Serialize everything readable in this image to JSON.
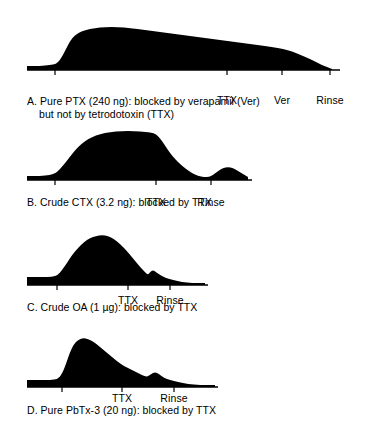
{
  "figure": {
    "type": "multi-panel-recording-traces",
    "panel_count": 4,
    "ink_color": "#000000",
    "background_color": "#ffffff"
  },
  "panels": [
    {
      "id": "A",
      "caption_line1": "A. Pure PTX (240 ng): blocked by verapamil (Ver)",
      "caption_line2": "but not by tetrodotoxin (TTX)",
      "axis_markers": [
        {
          "label": "",
          "x": 55
        },
        {
          "label": "TTX",
          "x": 227
        },
        {
          "label": "Ver",
          "x": 282
        },
        {
          "label": "Rinse",
          "x": 330
        }
      ]
    },
    {
      "id": "B",
      "caption_line1": "B. Crude CTX (3.2 ng): blocked by TTX",
      "caption_line2": "",
      "axis_markers": [
        {
          "label": "",
          "x": 55
        },
        {
          "label": "TTX",
          "x": 156
        },
        {
          "label": "Rinse",
          "x": 211
        }
      ]
    },
    {
      "id": "C",
      "caption_line1": "C. Crude OA (1 µg): blocked by TTX",
      "caption_line2": "",
      "axis_markers": [
        {
          "label": "",
          "x": 57
        },
        {
          "label": "TTX",
          "x": 128
        },
        {
          "label": "Rinse",
          "x": 170
        }
      ]
    },
    {
      "id": "D",
      "caption_line1": "D. Pure PbTx-3 (20 ng): blocked by TTX",
      "caption_line2": "",
      "axis_markers": [
        {
          "label": "",
          "x": 62
        },
        {
          "label": "TTX",
          "x": 122
        },
        {
          "label": "Rinse",
          "x": 174
        }
      ]
    }
  ],
  "chart_data": {
    "type": "area",
    "title": "",
    "xlabel": "",
    "ylabel": "",
    "grid": false,
    "legend": "none",
    "series": [
      {
        "name": "A. Pure PTX (240 ng)",
        "baseline_y": 70,
        "x_start": 27,
        "x_end": 332,
        "points": [
          [
            27,
            66
          ],
          [
            40,
            66
          ],
          [
            50,
            65
          ],
          [
            56,
            64
          ],
          [
            60,
            60
          ],
          [
            64,
            53
          ],
          [
            68,
            45
          ],
          [
            72,
            38
          ],
          [
            78,
            33
          ],
          [
            85,
            30
          ],
          [
            95,
            28
          ],
          [
            105,
            27
          ],
          [
            118,
            27
          ],
          [
            130,
            28
          ],
          [
            145,
            30
          ],
          [
            160,
            32
          ],
          [
            175,
            34
          ],
          [
            190,
            36
          ],
          [
            205,
            38
          ],
          [
            220,
            40
          ],
          [
            235,
            42
          ],
          [
            250,
            44
          ],
          [
            265,
            46
          ],
          [
            278,
            48
          ],
          [
            288,
            50
          ],
          [
            296,
            53
          ],
          [
            303,
            56
          ],
          [
            310,
            59
          ],
          [
            316,
            62
          ],
          [
            322,
            65
          ],
          [
            327,
            67
          ],
          [
            332,
            69
          ]
        ]
      },
      {
        "name": "B. Crude CTX (3.2 ng)",
        "baseline_y": 180,
        "x_start": 27,
        "x_end": 248,
        "points": [
          [
            27,
            176
          ],
          [
            40,
            176
          ],
          [
            50,
            175
          ],
          [
            56,
            173
          ],
          [
            60,
            169
          ],
          [
            66,
            162
          ],
          [
            72,
            154
          ],
          [
            78,
            147
          ],
          [
            85,
            141
          ],
          [
            92,
            137
          ],
          [
            100,
            134
          ],
          [
            110,
            132
          ],
          [
            122,
            131
          ],
          [
            134,
            131
          ],
          [
            146,
            132
          ],
          [
            154,
            133
          ],
          [
            158,
            136
          ],
          [
            162,
            141
          ],
          [
            166,
            147
          ],
          [
            170,
            153
          ],
          [
            175,
            159
          ],
          [
            180,
            164
          ],
          [
            186,
            169
          ],
          [
            192,
            173
          ],
          [
            198,
            176
          ],
          [
            204,
            177
          ],
          [
            209,
            177
          ],
          [
            213,
            175
          ],
          [
            218,
            171
          ],
          [
            223,
            168
          ],
          [
            228,
            167
          ],
          [
            233,
            168
          ],
          [
            238,
            171
          ],
          [
            243,
            174
          ],
          [
            248,
            177
          ]
        ]
      },
      {
        "name": "C. Crude OA (1 µg)",
        "baseline_y": 285,
        "x_start": 27,
        "x_end": 205,
        "points": [
          [
            27,
            277
          ],
          [
            42,
            277
          ],
          [
            52,
            277
          ],
          [
            58,
            275
          ],
          [
            62,
            270
          ],
          [
            67,
            263
          ],
          [
            72,
            255
          ],
          [
            78,
            248
          ],
          [
            84,
            242
          ],
          [
            90,
            238
          ],
          [
            96,
            236
          ],
          [
            102,
            235
          ],
          [
            108,
            236
          ],
          [
            114,
            239
          ],
          [
            120,
            244
          ],
          [
            126,
            250
          ],
          [
            131,
            256
          ],
          [
            136,
            262
          ],
          [
            141,
            268
          ],
          [
            145,
            272
          ],
          [
            148,
            275
          ],
          [
            150,
            272
          ],
          [
            153,
            270
          ],
          [
            156,
            272
          ],
          [
            160,
            275
          ],
          [
            166,
            278
          ],
          [
            173,
            280
          ],
          [
            182,
            282
          ],
          [
            192,
            283
          ],
          [
            205,
            283
          ]
        ]
      },
      {
        "name": "D. Pure PbTx-3 (20 ng)",
        "baseline_y": 387,
        "x_start": 27,
        "x_end": 215,
        "points": [
          [
            27,
            380
          ],
          [
            40,
            380
          ],
          [
            50,
            380
          ],
          [
            58,
            379
          ],
          [
            62,
            374
          ],
          [
            66,
            364
          ],
          [
            70,
            352
          ],
          [
            74,
            344
          ],
          [
            78,
            340
          ],
          [
            83,
            338
          ],
          [
            88,
            339
          ],
          [
            94,
            342
          ],
          [
            100,
            347
          ],
          [
            106,
            352
          ],
          [
            112,
            357
          ],
          [
            118,
            362
          ],
          [
            124,
            366
          ],
          [
            130,
            369
          ],
          [
            136,
            372
          ],
          [
            142,
            375
          ],
          [
            147,
            377
          ],
          [
            151,
            374
          ],
          [
            155,
            372
          ],
          [
            159,
            374
          ],
          [
            164,
            378
          ],
          [
            170,
            380
          ],
          [
            178,
            382
          ],
          [
            188,
            384
          ],
          [
            200,
            385
          ],
          [
            215,
            385
          ]
        ]
      }
    ]
  }
}
